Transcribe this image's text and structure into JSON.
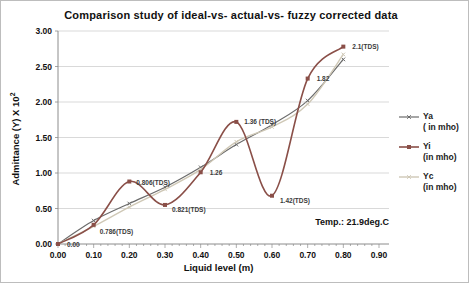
{
  "figure": {
    "temp_annotation": "Temp.: 21.9deg.C"
  },
  "chart_data": {
    "type": "line",
    "title": "Comparison study of  ideal-vs- actual-vs- fuzzy corrected  data",
    "xlabel": "Liquid level (m)",
    "ylabel": "Admittance (Y) X 10",
    "ylabel_superscript": "2",
    "xlim": [
      0,
      0.9
    ],
    "ylim": [
      0,
      3
    ],
    "grid": "horizontal",
    "legend_position": "right",
    "x_ticks": [
      "0.00",
      "0.10",
      "0.20",
      "0.30",
      "0.40",
      "0.50",
      "0.60",
      "0.70",
      "0.80",
      "0.90"
    ],
    "y_ticks": [
      "0.00",
      "0.50",
      "1.00",
      "1.50",
      "2.00",
      "2.50",
      "3.00"
    ],
    "x": [
      0.0,
      0.1,
      0.2,
      0.3,
      0.4,
      0.5,
      0.6,
      0.7,
      0.8
    ],
    "series": [
      {
        "name": "Ya",
        "legend_line1": "Ya",
        "legend_line2": "( in mho)",
        "color": "#6b6b6b",
        "marker": "x",
        "width": 1.2,
        "values": [
          0.0,
          0.33,
          0.57,
          0.8,
          1.08,
          1.4,
          1.68,
          2.02,
          2.6
        ]
      },
      {
        "name": "Yi",
        "legend_line1": "Yi",
        "legend_line2": "(in mho)",
        "color": "#8a4f48",
        "marker": "square",
        "width": 1.6,
        "values": [
          0.0,
          0.27,
          0.88,
          0.55,
          1.01,
          1.72,
          0.68,
          2.33,
          2.78
        ]
      },
      {
        "name": "Yc",
        "legend_line1": "Yc",
        "legend_line2": "(in mho)",
        "color": "#cfc8b6",
        "marker": "x",
        "width": 1.4,
        "values": [
          0.0,
          0.25,
          0.52,
          0.77,
          1.05,
          1.44,
          1.65,
          1.97,
          2.67
        ]
      }
    ],
    "point_labels": [
      {
        "x": 0.0,
        "y": 0.0,
        "text": "0.00",
        "dx": 9,
        "dy": 3
      },
      {
        "x": 0.1,
        "y": 0.27,
        "text": "0.786(TDS)",
        "dx": 6,
        "dy": 9
      },
      {
        "x": 0.2,
        "y": 0.88,
        "text": "0.806(TDS)",
        "dx": 7,
        "dy": 3
      },
      {
        "x": 0.3,
        "y": 0.55,
        "text": "0.821(TDS)",
        "dx": 7,
        "dy": 7
      },
      {
        "x": 0.4,
        "y": 1.01,
        "text": "1.26",
        "dx": 9,
        "dy": 3
      },
      {
        "x": 0.5,
        "y": 1.72,
        "text": "1.36 (TDS)",
        "dx": 8,
        "dy": 2
      },
      {
        "x": 0.6,
        "y": 0.68,
        "text": "1.42(TDS)",
        "dx": 8,
        "dy": 7
      },
      {
        "x": 0.7,
        "y": 2.33,
        "text": "1.82",
        "dx": 9,
        "dy": 2
      },
      {
        "x": 0.8,
        "y": 2.78,
        "text": "2.1(TDS)",
        "dx": 9,
        "dy": 2
      }
    ]
  }
}
